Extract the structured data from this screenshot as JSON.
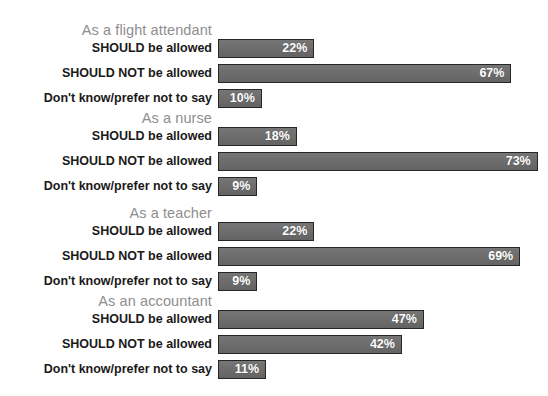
{
  "chart_data": {
    "type": "bar",
    "title": "",
    "xlabel": "",
    "ylabel": "",
    "xlim": [
      0,
      75
    ],
    "grid": false,
    "legend": null,
    "orientation": "horizontal",
    "value_suffix": "%",
    "categories": [
      "SHOULD be allowed",
      "SHOULD NOT be allowed",
      "Don't know/prefer not to say"
    ],
    "groups": [
      {
        "name": "As a flight attendant",
        "bars": [
          {
            "label": "SHOULD be allowed",
            "value": 22,
            "value_label": "22%"
          },
          {
            "label": "SHOULD NOT be allowed",
            "value": 67,
            "value_label": "67%"
          },
          {
            "label": "Don't know/prefer not to say",
            "value": 10,
            "value_label": "10%"
          }
        ]
      },
      {
        "name": "As a nurse",
        "bars": [
          {
            "label": "SHOULD be allowed",
            "value": 18,
            "value_label": "18%"
          },
          {
            "label": "SHOULD NOT be allowed",
            "value": 73,
            "value_label": "73%"
          },
          {
            "label": "Don't know/prefer not to say",
            "value": 9,
            "value_label": "9%"
          }
        ]
      },
      {
        "name": "As a teacher",
        "bars": [
          {
            "label": "SHOULD be allowed",
            "value": 22,
            "value_label": "22%"
          },
          {
            "label": "SHOULD NOT be allowed",
            "value": 69,
            "value_label": "69%"
          },
          {
            "label": "Don't know/prefer not to say",
            "value": 9,
            "value_label": "9%"
          }
        ]
      },
      {
        "name": "As an accountant",
        "bars": [
          {
            "label": "SHOULD be allowed",
            "value": 47,
            "value_label": "47%"
          },
          {
            "label": "SHOULD NOT be allowed",
            "value": 42,
            "value_label": "42%"
          },
          {
            "label": "Don't know/prefer not to say",
            "value": 11,
            "value_label": "11%"
          }
        ]
      }
    ],
    "colors": {
      "bar_fill": "#6c6c6c",
      "bar_border": "#262626",
      "bar_value_text": "#ffffff",
      "group_header_text": "#8e8e8e",
      "row_label_text": "#1a1a1a",
      "background": "#ffffff"
    }
  }
}
